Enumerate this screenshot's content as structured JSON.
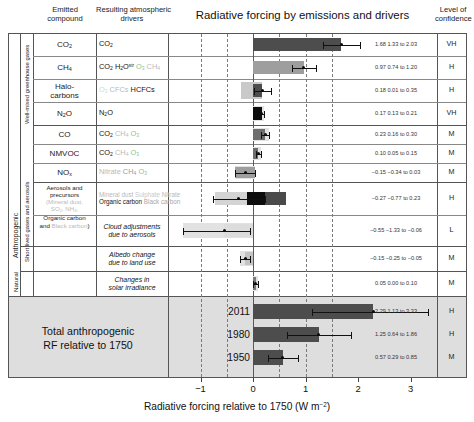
{
  "header": {
    "col_emitted": "Emitted\ncompound",
    "col_drivers": "Resulting atmospheric\ndrivers",
    "title": "Radiative forcing by emissions and drivers",
    "col_confidence": "Level of\nconfidence"
  },
  "side_labels": {
    "anthropogenic": "Anthropogenic",
    "natural": "Natural",
    "wmgg": "Well-mixed greenhouse gases",
    "slga": "Short lived gases and aerosols"
  },
  "axis": {
    "ticks": [
      -1,
      0,
      1,
      2,
      3
    ],
    "tick_labels": [
      "−1",
      "0",
      "1",
      "2",
      "3"
    ],
    "xmin": -1.45,
    "xmax": 3.55,
    "title": "Radiative forcing relative to 1750 (W m−2)"
  },
  "total_block": {
    "label": "Total anthropogenic\nRF relative to 1750"
  },
  "chart_data": {
    "type": "bar",
    "title": "Radiative forcing by emissions and drivers",
    "xlabel": "Radiative forcing relative to 1750 (W m−2)",
    "ylabel": "",
    "xlim": [
      -1.45,
      3.55
    ],
    "orientation": "horizontal",
    "grid": "dashed-vertical",
    "legend": "none",
    "rows": [
      {
        "compound": "CO2",
        "compound_html": "CO<sub>2</sub>",
        "drivers": [
          {
            "text": "CO",
            "sub": "2",
            "color": "#151515"
          }
        ],
        "value": 1.68,
        "low": 1.33,
        "high": 2.03,
        "value_text": "1.68 1.33 to 2.03",
        "confidence": "VH",
        "segments": [
          {
            "from": 0,
            "to": 1.68,
            "color": "#4d4d4d"
          }
        ],
        "band": null
      },
      {
        "compound": "CH4",
        "compound_html": "CH<sub>4</sub>",
        "drivers": [
          {
            "text": "CO",
            "sub": "2",
            "color": "#151515"
          },
          {
            "text": "H",
            "sub": "2",
            "post": "O",
            "sup": "str",
            "color": "#151515"
          },
          {
            "text": "O",
            "sub": "3",
            "color": "#8fbf8f"
          },
          {
            "text": "CH",
            "sub": "4",
            "color": "#b9b9b9"
          }
        ],
        "value": 0.97,
        "low": 0.74,
        "high": 1.2,
        "value_text": "0.97 0.74 to 1.20",
        "confidence": "H",
        "segments": [
          {
            "from": 0,
            "to": 0.97,
            "color": "#9e9e9e"
          }
        ],
        "band": null
      },
      {
        "compound": "Halo-carbons",
        "compound_html": "Halo-<br>carbons",
        "drivers": [
          {
            "text": "O",
            "sub": "3",
            "color": "#c9dfc9"
          },
          {
            "text": "CFCs",
            "color": "#b9b9b9"
          },
          {
            "text": "HCFCs",
            "color": "#151515"
          }
        ],
        "value": 0.18,
        "low": 0.01,
        "high": 0.35,
        "value_text": "0.18 0.01 to 0.35",
        "confidence": "H",
        "segments": [
          {
            "from": 0,
            "to": 0.18,
            "color": "#4d4d4d"
          }
        ],
        "band": {
          "from": -0.22,
          "to": 0.18,
          "color": "#c9c9c9"
        }
      },
      {
        "compound": "N2O",
        "compound_html": "N<sub>2</sub>O",
        "drivers": [
          {
            "text": "N",
            "sub": "2",
            "post": "O",
            "color": "#151515"
          }
        ],
        "value": 0.17,
        "low": 0.13,
        "high": 0.21,
        "value_text": "0.17 0.13 to 0.21",
        "confidence": "VH",
        "segments": [
          {
            "from": 0,
            "to": 0.17,
            "color": "#0d0d0d"
          }
        ],
        "band": null
      },
      {
        "compound": "CO",
        "compound_html": "CO",
        "drivers": [
          {
            "text": "CO",
            "sub": "2",
            "color": "#151515"
          },
          {
            "text": "CH",
            "sub": "4",
            "color": "#b9b9b9"
          },
          {
            "text": "O",
            "sub": "3",
            "color": "#8fbf8f"
          }
        ],
        "value": 0.23,
        "low": 0.16,
        "high": 0.3,
        "value_text": "0.23 0.16 to 0.30",
        "confidence": "M",
        "segments": [
          {
            "from": 0,
            "to": 0.23,
            "color": "#6e6e6e"
          }
        ],
        "band": null
      },
      {
        "compound": "NMVOC",
        "compound_html": "NMVOC",
        "drivers": [
          {
            "text": "CO",
            "sub": "2",
            "color": "#151515"
          },
          {
            "text": "CH",
            "sub": "4",
            "color": "#b9b9b9"
          },
          {
            "text": "O",
            "sub": "3",
            "color": "#8fbf8f"
          }
        ],
        "value": 0.1,
        "low": 0.05,
        "high": 0.15,
        "value_text": "0.10 0.05 to 0.15",
        "confidence": "M",
        "segments": [
          {
            "from": 0,
            "to": 0.1,
            "color": "#6e6e6e"
          }
        ],
        "band": null
      },
      {
        "compound": "NOx",
        "compound_html": "NO<sub>x</sub>",
        "drivers": [
          {
            "text": "Nitrate",
            "color": "#b9b9b9"
          },
          {
            "text": "CH",
            "sub": "4",
            "color": "#9a9a9a"
          },
          {
            "text": "O",
            "sub": "3",
            "color": "#8fbf8f"
          }
        ],
        "value": -0.15,
        "low": -0.34,
        "high": 0.03,
        "value_text": "−0.15 −0.34 to 0.03",
        "confidence": "M",
        "segments": [
          {
            "from": -0.34,
            "to": 0.03,
            "color": "#9e9e9e"
          }
        ],
        "band": null
      },
      {
        "compound": "Aerosols and precursors",
        "compound_html": "Aerosols and<br>precursors<br><span class='small g-ltgray'>(Mineral dust,<br>SO<sub>2</sub>, NH<sub>3</sub>,</span><br>Organic carbon<br>and <span class='g-ltgray'>Black carbon</span>)",
        "drivers": [
          {
            "text": "Mineral dust",
            "color": "#b9b9b9"
          },
          {
            "text": "Sulphate",
            "color": "#c9c9c9"
          },
          {
            "text": "Nitrate",
            "color": "#b9b9b9"
          },
          {
            "text": "Organic carbon",
            "color": "#151515"
          },
          {
            "text": "Black carbon",
            "color": "#a8a8a8"
          }
        ],
        "value": -0.27,
        "low": -0.77,
        "high": 0.23,
        "value_text": "−0.27 −0.77 to 0.23",
        "confidence": "H",
        "segments": [
          {
            "from": -0.72,
            "to": -0.12,
            "color": "#d4d4d4"
          },
          {
            "from": -0.12,
            "to": 0.22,
            "color": "#0d0d0d"
          },
          {
            "from": 0.22,
            "to": 0.63,
            "color": "#4a4a4a"
          }
        ],
        "band": null
      },
      {
        "compound": "",
        "compound_html": "",
        "drivers": [
          {
            "text": "Cloud adjustments\ndue to aerosols",
            "italic": true,
            "color": "#151515"
          }
        ],
        "value": -0.55,
        "low": -1.33,
        "high": -0.06,
        "value_text": "−0.55 −1.33 to −0.06",
        "confidence": "L",
        "segments": [
          {
            "from": -0.55,
            "to": 0.0,
            "color": "#dcdcdc"
          }
        ],
        "band": null
      },
      {
        "compound": "",
        "compound_html": "",
        "drivers": [
          {
            "text": "Albedo change\ndue to land use",
            "italic": true,
            "color": "#151515"
          }
        ],
        "value": -0.15,
        "low": -0.25,
        "high": -0.05,
        "value_text": "−0.15 −0.25 to −0.05",
        "confidence": "M",
        "segments": [
          {
            "from": -0.15,
            "to": 0.0,
            "color": "#c4c4c4"
          }
        ],
        "band": null
      },
      {
        "compound": "",
        "compound_html": "",
        "drivers": [
          {
            "text": "Changes in\nsolar irradiance",
            "italic": true,
            "color": "#151515"
          }
        ],
        "value": 0.05,
        "low": 0.0,
        "high": 0.1,
        "value_text": "0.05 0.00 to 0.10",
        "confidence": "M",
        "segments": [
          {
            "from": 0,
            "to": 0.05,
            "color": "#7a7a7a"
          }
        ],
        "band": null
      }
    ],
    "totals": [
      {
        "year": "2011",
        "value": 2.29,
        "low": 1.13,
        "high": 3.33,
        "value_text": "2.29 1.13 to 3.33",
        "confidence": "H",
        "segments": [
          {
            "from": 0,
            "to": 2.29,
            "color": "#4d4d4d"
          }
        ]
      },
      {
        "year": "1980",
        "value": 1.25,
        "low": 0.64,
        "high": 1.86,
        "value_text": "1.25 0.64 to 1.86",
        "confidence": "H",
        "segments": [
          {
            "from": 0,
            "to": 1.25,
            "color": "#4d4d4d"
          }
        ]
      },
      {
        "year": "1950",
        "value": 0.57,
        "low": 0.29,
        "high": 0.85,
        "value_text": "0.57 0.29 to 0.85",
        "confidence": "M",
        "segments": [
          {
            "from": 0,
            "to": 0.57,
            "color": "#4d4d4d"
          }
        ]
      }
    ]
  }
}
